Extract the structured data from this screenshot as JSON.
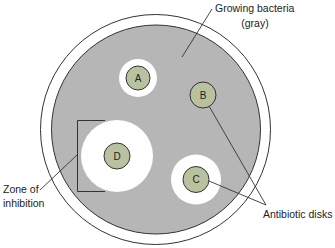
{
  "diagram": {
    "colors": {
      "plate_rim": "#ffffff",
      "bacteria_gray": "#b6b6b6",
      "zone_white": "#ffffff",
      "disk_fill": "#b9c29f",
      "outline": "#333333"
    },
    "labels": {
      "growing_line1": "Growing bacteria",
      "growing_line2": "(gray)",
      "zone_line1": "Zone of",
      "zone_line2": "inhibition",
      "disks": "Antibiotic disks"
    },
    "disks": [
      {
        "id": "A",
        "label": "A",
        "zone_radius": 19
      },
      {
        "id": "B",
        "label": "B",
        "zone_radius": 0
      },
      {
        "id": "C",
        "label": "C",
        "zone_radius": 25
      },
      {
        "id": "D",
        "label": "D",
        "zone_radius": 36
      }
    ]
  }
}
